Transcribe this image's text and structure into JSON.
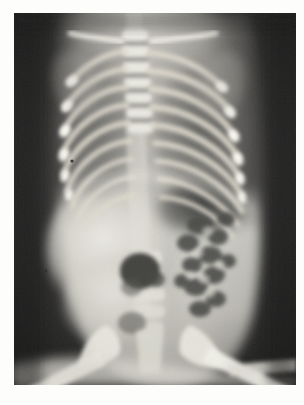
{
  "document": {
    "type": "scanned-radiograph-figure",
    "page_background": "#fdfdfc",
    "caption": ""
  },
  "radiograph": {
    "modality": "X-ray",
    "view": "AP (anteroposterior)",
    "subject": "infant / neonate",
    "region": "chest and abdomen",
    "plate": {
      "left": 14,
      "top": 13,
      "width": 282,
      "height": 372,
      "background_color": "#2c2c2c",
      "border_color": "#1a1a1a"
    },
    "tones": {
      "background_dark": "#262626",
      "background_dark_edge": "#1b1b1b",
      "soft_tissue_mid": "#8d8d8a",
      "soft_tissue_bright": "#d8d7d2",
      "bone_bright": "#f0efe9",
      "bone_highlight": "#fbfaf5",
      "gas_dark": "#3a3a38",
      "lung_field": "#6e6e6c"
    },
    "anatomy": [
      {
        "name": "cervical-thoracic-spine",
        "note": "midline vertebral column, segmented bodies visible"
      },
      {
        "name": "ribs-left",
        "note": "nine paired rib arcs, bright anterior ends"
      },
      {
        "name": "ribs-right",
        "note": "nine paired rib arcs, bright anterior ends"
      },
      {
        "name": "clavicles",
        "note": "upper oblique bright bands"
      },
      {
        "name": "scapulae",
        "note": "faint upper-lateral shadows"
      },
      {
        "name": "lung-fields",
        "note": "dark aerated areas between rib arcs"
      },
      {
        "name": "diaphragm",
        "note": "curved bright boundary beneath the rib cage"
      },
      {
        "name": "liver-shadow",
        "note": "bright homogeneous right upper abdomen"
      },
      {
        "name": "stomach-gas-bubble",
        "note": "rounded dark lucency left of midline"
      },
      {
        "name": "bowel-gas-pattern",
        "note": "mottled gas loops in left abdomen"
      },
      {
        "name": "lumbar-spine",
        "note": "lower midline vertebral bodies"
      },
      {
        "name": "pelvis-iliac-wings",
        "note": "bright bilateral wings at lower image"
      },
      {
        "name": "femurs",
        "note": "bright oblique bands at bottom corners"
      }
    ],
    "grain": {
      "enabled": true,
      "description": "film / scan noise speckle"
    }
  }
}
